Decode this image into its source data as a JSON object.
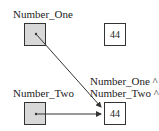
{
  "diagram": {
    "pointers": [
      {
        "name": "Number_One",
        "label": "Number_One"
      },
      {
        "name": "Number_Two",
        "label": "Number_Two"
      }
    ],
    "values": [
      {
        "name": "top-value",
        "value": "44"
      },
      {
        "name": "shared-value",
        "value": "44"
      }
    ],
    "deref_labels": [
      "Number_One ^",
      "Number_Two ^"
    ]
  }
}
